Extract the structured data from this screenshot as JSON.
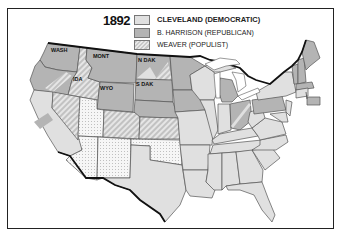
{
  "map": {
    "title_year": "1892",
    "legend": [
      {
        "label": "CLEVELAND (DEMOCRATIC)",
        "party": "democratic",
        "fill": "#e0e0e0",
        "pattern": "solid-light"
      },
      {
        "label": "B. HARRISON (REPUBLICAN)",
        "party": "republican",
        "fill": "#b4b4b4",
        "pattern": "solid-dark"
      },
      {
        "label": "WEAVER (POPULIST)",
        "party": "populist",
        "fill": "#d4d4d4",
        "pattern": "diagonal-hatch"
      }
    ],
    "split_pattern": {
      "description": "dotted (states not yet admitted / territories)",
      "fill": "#f4f4f4"
    },
    "state_labels": {
      "wash": "WASH",
      "mont": "MONT",
      "ida": "IDA",
      "wyo": "WYO",
      "ndak": "N DAK",
      "sdak": "S DAK"
    },
    "colors": {
      "frame": "#222222",
      "border": "#555555",
      "coast": "#111111"
    }
  }
}
